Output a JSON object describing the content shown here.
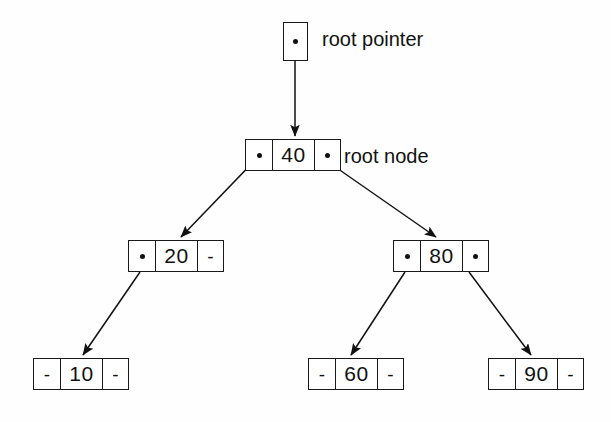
{
  "figure": {
    "background_color": "#fefefe",
    "ink_color": "#111111",
    "null_symbol": "-"
  },
  "labels": {
    "root_pointer": "root pointer",
    "root_node": "root node"
  },
  "diagram_data": {
    "type": "tree",
    "structure": "binary-search-tree",
    "root_value": "40",
    "nodes": [
      {
        "id": "root-pointer",
        "kind": "pointer-box",
        "cells": [
          "dot"
        ],
        "label": "root pointer",
        "x": 283,
        "y": 22
      },
      {
        "id": "node-40",
        "kind": "node",
        "value": "40",
        "left": "dot",
        "right": "dot",
        "label": "root node",
        "x": 245,
        "y": 139,
        "level": 0
      },
      {
        "id": "node-20",
        "kind": "node",
        "value": "20",
        "left": "dot",
        "right": "-",
        "x": 128,
        "y": 240,
        "level": 1
      },
      {
        "id": "node-80",
        "kind": "node",
        "value": "80",
        "left": "dot",
        "right": "dot",
        "x": 393,
        "y": 240,
        "level": 1
      },
      {
        "id": "node-10",
        "kind": "node",
        "value": "10",
        "left": "-",
        "right": "-",
        "x": 33,
        "y": 358,
        "level": 2
      },
      {
        "id": "node-60",
        "kind": "node",
        "value": "60",
        "left": "-",
        "right": "-",
        "x": 308,
        "y": 358,
        "level": 2
      },
      {
        "id": "node-90",
        "kind": "node",
        "value": "90",
        "left": "-",
        "right": "-",
        "x": 488,
        "y": 358,
        "level": 2
      }
    ],
    "edges": [
      {
        "id": "edge-rootptr-40",
        "from": "root-pointer",
        "to": "node-40",
        "x1": 295,
        "y1": 44,
        "x2": 295,
        "y2": 138
      },
      {
        "id": "edge-40-20",
        "from": "node-40",
        "to": "node-20",
        "x1": 258,
        "y1": 157,
        "x2": 180,
        "y2": 239
      },
      {
        "id": "edge-40-80",
        "from": "node-40",
        "to": "node-80",
        "x1": 321,
        "y1": 157,
        "x2": 437,
        "y2": 239
      },
      {
        "id": "edge-20-10",
        "from": "node-20",
        "to": "node-10",
        "x1": 140,
        "y1": 272,
        "x2": 82,
        "y2": 357
      },
      {
        "id": "edge-80-60",
        "from": "node-80",
        "to": "node-60",
        "x1": 405,
        "y1": 272,
        "x2": 350,
        "y2": 357
      },
      {
        "id": "edge-80-90",
        "from": "node-80",
        "to": "node-90",
        "x1": 469,
        "y1": 272,
        "x2": 532,
        "y2": 357
      }
    ]
  }
}
